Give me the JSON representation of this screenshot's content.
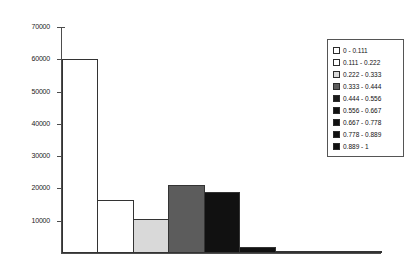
{
  "chart_data": {
    "type": "bar",
    "title": "",
    "xlabel": "",
    "ylabel": "",
    "ylim": [
      0,
      70000
    ],
    "ytick_values": [
      0,
      10000,
      20000,
      30000,
      40000,
      50000,
      60000,
      70000
    ],
    "ytick_labels": [
      "0",
      "10000",
      "20000",
      "30000",
      "40000",
      "50000",
      "60000",
      "70000"
    ],
    "grid": false,
    "legend_position": "upper-right",
    "categories": [
      "0 - 0.111",
      "0.111 - 0.222",
      "0.222 - 0.333",
      "0.333 - 0.444",
      "0.444 - 0.556",
      "0.556 - 0.667",
      "0.667 - 0.778",
      "0.778 - 0.889",
      "0.889 - 1"
    ],
    "values": [
      60100,
      16300,
      10500,
      21000,
      19000,
      1800,
      500,
      200,
      100
    ],
    "bar_colors": [
      "#ffffff",
      "#ffffff",
      "#d9d9d9",
      "#5c5c5c",
      "#111111",
      "#111111",
      "#111111",
      "#111111",
      "#111111"
    ]
  },
  "legend": {
    "entries": [
      {
        "label": "0 - 0.111",
        "color": "#ffffff"
      },
      {
        "label": "0.111 - 0.222",
        "color": "#ffffff"
      },
      {
        "label": "0.222 - 0.333",
        "color": "#d9d9d9"
      },
      {
        "label": "0.333 - 0.444",
        "color": "#5c5c5c"
      },
      {
        "label": "0.444 - 0.556",
        "color": "#1a1a1a"
      },
      {
        "label": "0.556 - 0.667",
        "color": "#111111"
      },
      {
        "label": "0.667 - 0.778",
        "color": "#111111"
      },
      {
        "label": "0.778 - 0.889",
        "color": "#111111"
      },
      {
        "label": "0.889 - 1",
        "color": "#111111"
      }
    ]
  }
}
